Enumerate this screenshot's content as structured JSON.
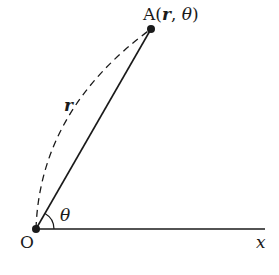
{
  "diagram": {
    "point_A_label": "A(",
    "point_A_r": "r",
    "point_A_comma": ", ",
    "point_A_theta": "θ",
    "point_A_close": ")",
    "origin_label": "O",
    "axis_label": "x",
    "radius_label": "r",
    "angle_label": "θ",
    "colors": {
      "line": "#1a1a1a",
      "background": "#ffffff"
    }
  }
}
